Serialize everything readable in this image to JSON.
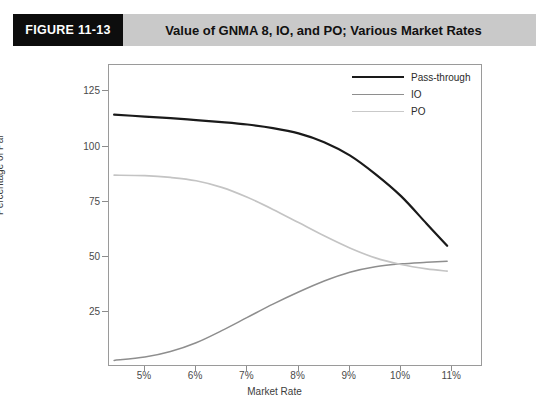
{
  "header": {
    "figure_number": "FIGURE 11-13",
    "title": "Value of GNMA 8, IO, and PO; Various Market Rates",
    "band_color": "#c9c9c9",
    "number_box_color": "#0d0d0d"
  },
  "chart_data": {
    "type": "line",
    "title": "Value of GNMA 8, IO, and PO; Various Market Rates",
    "xlabel": "Market Rate",
    "ylabel": "Percentage of Par",
    "grid": false,
    "legend_position": "top-right",
    "xlim": [
      4.3,
      11.6
    ],
    "ylim": [
      0,
      137
    ],
    "xticks": [
      5,
      6,
      7,
      8,
      9,
      10,
      11
    ],
    "xtick_labels": [
      "5%",
      "6%",
      "7%",
      "8%",
      "9%",
      "10%",
      "11%"
    ],
    "yticks": [
      25,
      50,
      75,
      100,
      125
    ],
    "ytick_labels": [
      "25",
      "50",
      "75",
      "100",
      "125"
    ],
    "x": [
      4.4,
      5.0,
      5.5,
      6.0,
      6.5,
      7.0,
      7.5,
      8.0,
      8.5,
      9.0,
      9.5,
      10.0,
      10.5,
      10.9
    ],
    "series": [
      {
        "name": "Pass-through",
        "color": "#1a1a1a",
        "width": 2.2,
        "values": [
          114.5,
          113.6,
          112.9,
          112.0,
          111.1,
          110.0,
          108.4,
          106.0,
          102.0,
          96.0,
          87.5,
          77.5,
          65.0,
          55.0
        ]
      },
      {
        "name": "IO",
        "color": "#8e8e8e",
        "width": 1.5,
        "values": [
          3.0,
          4.5,
          7.0,
          11.0,
          16.5,
          22.5,
          28.5,
          34.0,
          39.0,
          43.0,
          45.5,
          46.8,
          47.5,
          48.0
        ]
      },
      {
        "name": "PO",
        "color": "#c4c4c4",
        "width": 1.7,
        "values": [
          87.0,
          86.8,
          86.0,
          84.5,
          81.5,
          77.0,
          71.5,
          65.5,
          59.5,
          54.0,
          49.5,
          46.5,
          44.5,
          43.5
        ]
      }
    ]
  },
  "legend": {
    "items": [
      {
        "label": "Pass-through",
        "color": "#1a1a1a",
        "width": "2.4px"
      },
      {
        "label": "IO",
        "color": "#8e8e8e",
        "width": "1.4px"
      },
      {
        "label": "PO",
        "color": "#c9c9c9",
        "width": "1.6px"
      }
    ]
  }
}
